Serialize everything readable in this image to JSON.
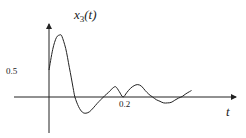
{
  "chart_data": {
    "type": "line",
    "title": "",
    "ylabel": "x3(t)",
    "ylabel_parts": {
      "base": "x",
      "sub": "3",
      "arg": "(t)"
    },
    "xlabel": "t",
    "x_ticks": [
      {
        "value": 0.2,
        "label": "0.2"
      }
    ],
    "y_ticks": [
      {
        "value": 0.5,
        "label": "0.5"
      }
    ],
    "grid": false,
    "legend": null,
    "xlim": [
      -0.095,
      0.505
    ],
    "ylim": [
      -0.67,
      1.38
    ],
    "series": [
      {
        "name": "x3(t)",
        "x": [
          0.0,
          0.01,
          0.02,
          0.03,
          0.035,
          0.045,
          0.055,
          0.065,
          0.07,
          0.08,
          0.09,
          0.1,
          0.11,
          0.12,
          0.13,
          0.14,
          0.15,
          0.16,
          0.17,
          0.18,
          0.19,
          0.2,
          0.21,
          0.22,
          0.23,
          0.24,
          0.25,
          0.26,
          0.27,
          0.28,
          0.29,
          0.3,
          0.31,
          0.32,
          0.33,
          0.34,
          0.35,
          0.36,
          0.37,
          0.38,
          0.385
        ],
        "values": [
          0.5,
          0.88,
          1.1,
          1.15,
          1.12,
          0.9,
          0.55,
          0.18,
          0.0,
          -0.18,
          -0.28,
          -0.3,
          -0.27,
          -0.2,
          -0.12,
          -0.05,
          0.02,
          0.08,
          0.15,
          0.19,
          0.1,
          0.0,
          0.08,
          0.16,
          0.21,
          0.23,
          0.2,
          0.12,
          0.05,
          0.0,
          -0.05,
          -0.08,
          -0.11,
          -0.11,
          -0.1,
          -0.06,
          -0.02,
          0.01,
          0.06,
          0.1,
          0.12
        ]
      }
    ],
    "annotations": []
  },
  "colors": {
    "axis": "#222222",
    "curve": "#222222",
    "background": "#ffffff"
  }
}
